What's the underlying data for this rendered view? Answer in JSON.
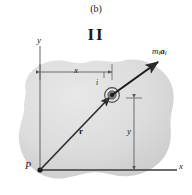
{
  "figure": {
    "caption": "(b)",
    "roman_numeral": "II",
    "axes": {
      "y_label": "y",
      "x_label": "x",
      "origin_label": "P"
    },
    "dimensions": {
      "horizontal_label": "x",
      "vertical_label": "y"
    },
    "vectors": {
      "position_label": "r",
      "force_label_m": "m",
      "force_label_m_sub": "i",
      "force_label_a": "a",
      "force_label_a_sub": "i"
    },
    "particle": {
      "index_label": "i"
    },
    "colors": {
      "body_fill": "#d2d2d2",
      "body_fill_light": "#e4e4e4",
      "line": "#3a3a3a",
      "dimension_line": "#6a6a6a",
      "text": "#1a1a1a",
      "background": "#ffffff"
    }
  }
}
